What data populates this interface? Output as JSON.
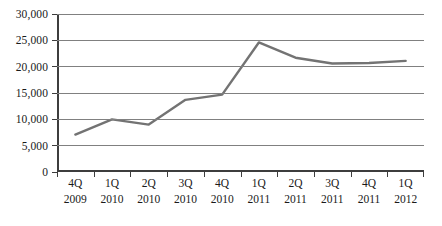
{
  "chart_data": {
    "type": "line",
    "title": "",
    "subtitle": "",
    "xlabel": "",
    "ylabel": "",
    "categories": [
      "4Q 2009",
      "1Q 2010",
      "2Q 2010",
      "3Q 2010",
      "4Q 2010",
      "1Q 2011",
      "2Q 2011",
      "3Q 2011",
      "4Q 2011",
      "1Q 2012"
    ],
    "category_parts": [
      {
        "quarter": "4Q",
        "year": "2009"
      },
      {
        "quarter": "1Q",
        "year": "2010"
      },
      {
        "quarter": "2Q",
        "year": "2010"
      },
      {
        "quarter": "3Q",
        "year": "2010"
      },
      {
        "quarter": "4Q",
        "year": "2010"
      },
      {
        "quarter": "1Q",
        "year": "2011"
      },
      {
        "quarter": "2Q",
        "year": "2011"
      },
      {
        "quarter": "3Q",
        "year": "2011"
      },
      {
        "quarter": "4Q",
        "year": "2011"
      },
      {
        "quarter": "1Q",
        "year": "2012"
      }
    ],
    "values": [
      7100,
      10000,
      9000,
      13700,
      14700,
      24600,
      21700,
      20600,
      20700,
      21100
    ],
    "ylim": [
      0,
      30000
    ],
    "ytick_values": [
      0,
      5000,
      10000,
      15000,
      20000,
      25000,
      30000
    ],
    "ytick_labels": [
      "0",
      "5,000",
      "10,000",
      "15,000",
      "20,000",
      "25,000",
      "30,000"
    ],
    "grid": true,
    "legend": false,
    "legend_position": "none",
    "series_color": "#737373",
    "axis_color": "#3d3d3d",
    "gridline_color": "#808080",
    "text_color": "#1a1a1a"
  }
}
